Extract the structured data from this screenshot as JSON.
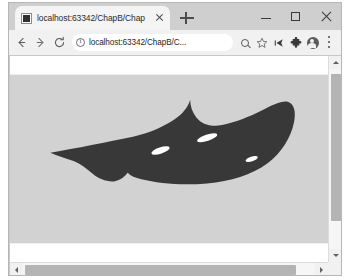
{
  "window": {
    "controls": {
      "minimize_label": "Minimize",
      "maximize_label": "Maximize",
      "close_label": "Close"
    }
  },
  "tabstrip": {
    "tabs": [
      {
        "title": "localhost:63342/ChapB/Chap",
        "favicon": "page-favicon",
        "close_label": "Close tab",
        "active": true
      }
    ],
    "new_tab_label": "New tab"
  },
  "toolbar": {
    "back_label": "←",
    "forward_label": "→",
    "reload_label": "⟳",
    "omnibox": {
      "security_icon": "info-circle-icon",
      "url": "localhost:63342/ChapB/C...",
      "placeholder": "Search Google or type a URL"
    },
    "actions": [
      {
        "name": "zoom-icon",
        "glyph": ""
      },
      {
        "name": "bookmark-star-icon",
        "glyph": "☆"
      },
      {
        "name": "cast-icon",
        "glyph": ""
      },
      {
        "name": "extensions-puzzle-icon",
        "glyph": ""
      },
      {
        "name": "profile-avatar-icon",
        "glyph": ""
      },
      {
        "name": "chrome-menu-icon",
        "glyph": ""
      }
    ]
  },
  "page": {
    "background_color": "#ffffff",
    "graphic": {
      "name": "dark-organic-silhouette",
      "description": "Dark charcoal leaf/stingray-like silhouette with a long pointed tail to the left, a concave notch on the upper right and a rounded bulbous right end, containing three small white elliptical holes.",
      "fill_color": "#3a3a3a",
      "hole_color": "#ffffff",
      "body_path": "M 38 74 C 62 70 92 64 116 59 C 133 55 146 49 156 42 C 163 37 168 31 170 24 C 170 30 172 36 176 41 C 181 47 189 50 200 48 C 214 45 226 40 236 35 C 248 29 256 25 262 26 C 268 28 270 35 268 45 C 265 60 256 74 243 84 C 228 95 208 101 186 103 C 162 105 140 103 124 99 C 118 98 114 96 111 93 C 108 97 104 100 99 101 C 92 102 84 99 78 94 C 72 89 67 85 60 82 C 52 79 45 77 38 74 Z",
      "holes": [
        {
          "cx": 186,
          "cy": 60,
          "rx": 10,
          "ry": 3,
          "rotate": -18
        },
        {
          "cx": 142,
          "cy": 72,
          "rx": 9,
          "ry": 3,
          "rotate": -18
        },
        {
          "cx": 228,
          "cy": 80,
          "rx": 6,
          "ry": 2.2,
          "rotate": -18
        }
      ]
    }
  },
  "scrollbars": {
    "vertical": {
      "up_label": "Scroll up",
      "down_label": "Scroll down",
      "thumb_top_pct": 7,
      "thumb_height_pct": 74
    },
    "horizontal": {
      "left_label": "Scroll left",
      "right_label": "Scroll right",
      "thumb_left_pct": 3,
      "thumb_width_pct": 88
    }
  }
}
